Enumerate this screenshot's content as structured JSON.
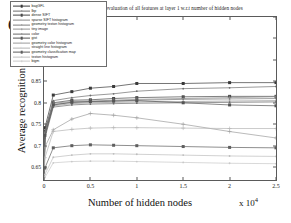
{
  "figure": {
    "panel_label": "(a)",
    "title": "Performance evaluation of all features at layer 1 w.r.t number of hidden nodes",
    "ylabel": "Average recognition rate",
    "xlabel": "Number of hidden nodes",
    "x_multiplier": "x 10",
    "x_multiplier_exp": "4"
  },
  "chart_data": {
    "type": "line",
    "title": "Performance evaluation of all features at layer 1 w.r.t number of hidden nodes",
    "xlabel": "Number of hidden nodes",
    "ylabel": "Average recognition rate",
    "x_axis_multiplier": 10000,
    "xlim": [
      0,
      25000
    ],
    "ylim": [
      0.62,
      1.0
    ],
    "grid": false,
    "legend_position": "upper-left-inside",
    "xticks": [
      "0",
      "0.5",
      "1",
      "1.5",
      "2",
      "2.5"
    ],
    "xtick_values": [
      0,
      5000,
      10000,
      15000,
      20000,
      25000
    ],
    "yticks": [
      "1",
      "0.95",
      "0.9",
      "0.85",
      "0.8",
      "0.75",
      "0.7",
      "0.65"
    ],
    "ytick_values": [
      1,
      0.95,
      0.9,
      0.85,
      0.8,
      0.75,
      0.7,
      0.65
    ],
    "x": [
      100,
      1000,
      3000,
      5000,
      7500,
      10000,
      15000,
      20000,
      25000
    ],
    "series": [
      {
        "name": "bagGFL",
        "color": "#3a3a3a",
        "marker": "square",
        "values": [
          0.742,
          0.818,
          0.826,
          0.834,
          0.838,
          0.845,
          0.845,
          0.847,
          0.847
        ]
      },
      {
        "name": "lbp",
        "color": "#6e6e6e",
        "marker": "none",
        "values": [
          0.735,
          0.805,
          0.812,
          0.817,
          0.821,
          0.827,
          0.833,
          0.835,
          0.838
        ]
      },
      {
        "name": "dense SIFT",
        "color": "#4a4a4a",
        "marker": "square",
        "values": [
          0.733,
          0.8,
          0.806,
          0.807,
          0.81,
          0.812,
          0.814,
          0.815,
          0.815
        ]
      },
      {
        "name": "sparse SIFT histogram",
        "color": "#8a8a8a",
        "marker": "plus",
        "values": [
          0.73,
          0.799,
          0.803,
          0.804,
          0.806,
          0.808,
          0.81,
          0.812,
          0.814
        ]
      },
      {
        "name": "geometry texton histogram",
        "color": "#7d7d7d",
        "marker": "none",
        "values": [
          0.726,
          0.796,
          0.801,
          0.802,
          0.804,
          0.806,
          0.808,
          0.809,
          0.81
        ]
      },
      {
        "name": "tiny image",
        "color": "#959595",
        "marker": "none",
        "values": [
          0.722,
          0.793,
          0.798,
          0.8,
          0.801,
          0.802,
          0.803,
          0.804,
          0.805
        ]
      },
      {
        "name": "color",
        "color": "#6a6a6a",
        "marker": "none",
        "values": [
          0.718,
          0.79,
          0.795,
          0.797,
          0.798,
          0.799,
          0.8,
          0.801,
          0.802
        ]
      },
      {
        "name": "gist",
        "color": "#555555",
        "marker": "square",
        "values": [
          0.724,
          0.795,
          0.801,
          0.803,
          0.804,
          0.805,
          0.8,
          0.795,
          0.793
        ]
      },
      {
        "name": "geometry color histogram",
        "color": "#9c9c9c",
        "marker": "plus",
        "values": [
          0.697,
          0.737,
          0.762,
          0.775,
          0.771,
          0.765,
          0.75,
          0.733,
          0.718
        ]
      },
      {
        "name": "straight line histogram",
        "color": "#b4b4b4",
        "marker": "plus",
        "values": [
          0.672,
          0.733,
          0.738,
          0.741,
          0.742,
          0.742,
          0.741,
          0.74,
          0.74
        ]
      },
      {
        "name": "geometry classification map",
        "color": "#5f5f5f",
        "marker": "square",
        "values": [
          0.648,
          0.695,
          0.7,
          0.702,
          0.701,
          0.7,
          0.698,
          0.696,
          0.695
        ]
      },
      {
        "name": "texton histogram",
        "color": "#bdbdbd",
        "marker": "none",
        "values": [
          0.633,
          0.673,
          0.678,
          0.681,
          0.681,
          0.68,
          0.678,
          0.676,
          0.675
        ]
      },
      {
        "name": "bigm",
        "color": "#c9c9c9",
        "marker": "none",
        "values": [
          0.626,
          0.66,
          0.663,
          0.664,
          0.664,
          0.663,
          0.661,
          0.659,
          0.658
        ]
      }
    ]
  }
}
